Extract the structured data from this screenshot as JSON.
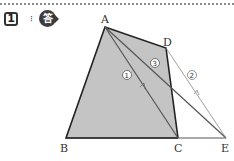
{
  "header": {
    "problem_number": "1",
    "spark_glyph": "⁝",
    "answer_label": "答"
  },
  "figure": {
    "fill_color": "#c4c4c4",
    "points": {
      "A": {
        "label": "A",
        "x": 105,
        "y": 27
      },
      "B": {
        "label": "B",
        "x": 66,
        "y": 138
      },
      "C": {
        "label": "C",
        "x": 178,
        "y": 138
      },
      "D": {
        "label": "D",
        "x": 166,
        "y": 48
      },
      "E": {
        "label": "E",
        "x": 226,
        "y": 138
      }
    },
    "line_labels": {
      "one": "①",
      "two": "②",
      "three": "③"
    }
  }
}
